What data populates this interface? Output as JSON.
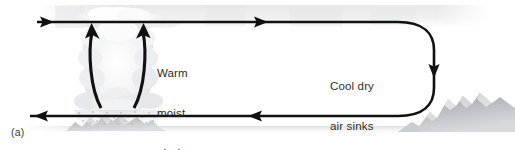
{
  "figure": {
    "panel_label": "(a)",
    "background_color": "#ffffff",
    "ink_color": "#111111",
    "text_color": "#2b2b2b",
    "haze_band_color": "#ededee",
    "cloud_color": "#e9eaec",
    "mountain_color": "#b9bcc0",
    "ground_color": "#e4e5e7"
  },
  "annotations": {
    "rising": {
      "lines": [
        "Warm",
        "moist",
        "air rises"
      ],
      "line1": "Warm",
      "line2": "moist",
      "line3": "air rises"
    },
    "sinking": {
      "lines": [
        "Cool dry",
        "air sinks"
      ],
      "line1": "Cool dry",
      "line2": "air sinks"
    }
  },
  "flow": {
    "top_branch": {
      "name": "upper-level outflow",
      "direction": "left-to-right",
      "arrowheads": 2,
      "y": 22
    },
    "bottom_branch": {
      "name": "surface return flow",
      "direction": "right-to-left",
      "arrowheads": 2,
      "y": 115
    },
    "updraft": {
      "name": "convective updraft",
      "direction": "upward",
      "arrowheads": 2
    },
    "turn": {
      "name": "subsidence u-turn",
      "direction": "descending",
      "x_center": 408
    }
  },
  "scene_elements": {
    "cloud": "cumulonimbus-cloud",
    "precipitation": "precipitation-shading",
    "left_terrain": "left-mountain-range",
    "right_terrain": "right-mountain-range",
    "haze": "upper-atmosphere-haze-band",
    "ground": "ground-line"
  }
}
